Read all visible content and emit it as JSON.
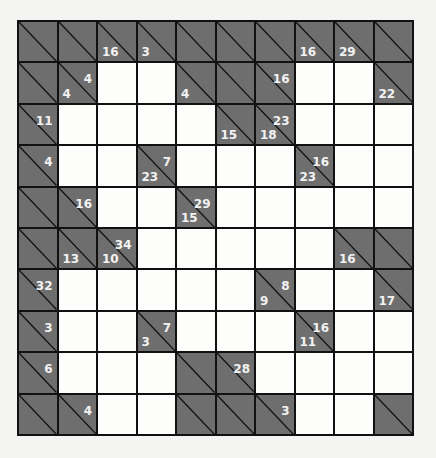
{
  "puzzle": {
    "type": "kakuro",
    "rows": 10,
    "cols": 10,
    "colors": {
      "clue_bg": "#6e6e6e",
      "white_bg": "#fdfdfc",
      "line": "#111111",
      "clue_text": "#f2f2f2"
    },
    "grid": [
      [
        {
          "t": "b"
        },
        {
          "t": "b"
        },
        {
          "t": "c",
          "d": "16"
        },
        {
          "t": "c",
          "d": "3"
        },
        {
          "t": "b"
        },
        {
          "t": "b"
        },
        {
          "t": "b"
        },
        {
          "t": "c",
          "d": "16"
        },
        {
          "t": "c",
          "d": "29"
        },
        {
          "t": "b"
        }
      ],
      [
        {
          "t": "b"
        },
        {
          "t": "c",
          "d": "4",
          "r": "4"
        },
        {
          "t": "w"
        },
        {
          "t": "w"
        },
        {
          "t": "c",
          "d": "4"
        },
        {
          "t": "b"
        },
        {
          "t": "c",
          "r": "16"
        },
        {
          "t": "w"
        },
        {
          "t": "w"
        },
        {
          "t": "c",
          "d": "22"
        }
      ],
      [
        {
          "t": "c",
          "r": "11"
        },
        {
          "t": "w"
        },
        {
          "t": "w"
        },
        {
          "t": "w"
        },
        {
          "t": "w"
        },
        {
          "t": "c",
          "d": "15"
        },
        {
          "t": "c",
          "d": "18",
          "r": "23"
        },
        {
          "t": "w"
        },
        {
          "t": "w"
        },
        {
          "t": "w"
        }
      ],
      [
        {
          "t": "c",
          "r": "4"
        },
        {
          "t": "w"
        },
        {
          "t": "w"
        },
        {
          "t": "c",
          "d": "23",
          "r": "7"
        },
        {
          "t": "w"
        },
        {
          "t": "w"
        },
        {
          "t": "w"
        },
        {
          "t": "c",
          "d": "23",
          "r": "16"
        },
        {
          "t": "w"
        },
        {
          "t": "w"
        }
      ],
      [
        {
          "t": "b"
        },
        {
          "t": "c",
          "r": "16"
        },
        {
          "t": "w"
        },
        {
          "t": "w"
        },
        {
          "t": "c",
          "d": "15",
          "r": "29"
        },
        {
          "t": "w"
        },
        {
          "t": "w"
        },
        {
          "t": "w"
        },
        {
          "t": "w"
        },
        {
          "t": "w"
        }
      ],
      [
        {
          "t": "b"
        },
        {
          "t": "c",
          "d": "13"
        },
        {
          "t": "c",
          "d": "10",
          "r": "34"
        },
        {
          "t": "w"
        },
        {
          "t": "w"
        },
        {
          "t": "w"
        },
        {
          "t": "w"
        },
        {
          "t": "w"
        },
        {
          "t": "c",
          "d": "16"
        },
        {
          "t": "b"
        }
      ],
      [
        {
          "t": "c",
          "r": "32"
        },
        {
          "t": "w"
        },
        {
          "t": "w"
        },
        {
          "t": "w"
        },
        {
          "t": "w"
        },
        {
          "t": "w"
        },
        {
          "t": "c",
          "d": "9",
          "r": "8"
        },
        {
          "t": "w"
        },
        {
          "t": "w"
        },
        {
          "t": "c",
          "d": "17"
        }
      ],
      [
        {
          "t": "c",
          "r": "3"
        },
        {
          "t": "w"
        },
        {
          "t": "w"
        },
        {
          "t": "c",
          "d": "3",
          "r": "7"
        },
        {
          "t": "w"
        },
        {
          "t": "w"
        },
        {
          "t": "w"
        },
        {
          "t": "c",
          "d": "11",
          "r": "16"
        },
        {
          "t": "w"
        },
        {
          "t": "w"
        }
      ],
      [
        {
          "t": "c",
          "r": "6"
        },
        {
          "t": "w"
        },
        {
          "t": "w"
        },
        {
          "t": "w"
        },
        {
          "t": "b"
        },
        {
          "t": "c",
          "r": "28"
        },
        {
          "t": "w"
        },
        {
          "t": "w"
        },
        {
          "t": "w"
        },
        {
          "t": "w"
        }
      ],
      [
        {
          "t": "b"
        },
        {
          "t": "c",
          "r": "4"
        },
        {
          "t": "w"
        },
        {
          "t": "w"
        },
        {
          "t": "b"
        },
        {
          "t": "b"
        },
        {
          "t": "c",
          "r": "3"
        },
        {
          "t": "w"
        },
        {
          "t": "w"
        },
        {
          "t": "b"
        }
      ]
    ]
  }
}
